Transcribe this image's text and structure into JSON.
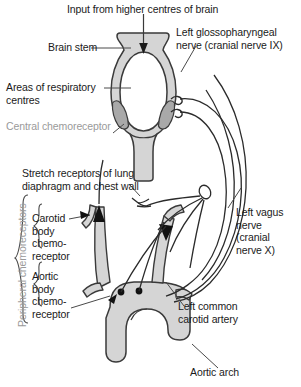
{
  "figure": {
    "type": "anatomical-diagram",
    "width": 301,
    "height": 387,
    "background": "#ffffff"
  },
  "colors": {
    "vessel_fill": "#d5d5d5",
    "vessel_stroke": "#3a3a3a",
    "chemoreceptor_fill": "#a9a9a9",
    "nerve_stroke": "#2b2b2b",
    "label_text": "#1a1a1a",
    "muted_text": "#9a9a9a",
    "leader_line": "#4a4a4a"
  },
  "labels": {
    "input_brain": "Input from higher centres of brain",
    "brain_stem": "Brain stem",
    "glossopharyngeal": "Left glossopharyngeal\nnerve (cranial nerve IX)",
    "respiratory_centres": "Areas of respiratory\ncentres",
    "central_chemoreceptor": "Central chemoreceptor",
    "stretch_receptors": "Stretch receptors of lung\ndiaphragm and chest wall",
    "peripheral_chemoreceptors": "Peripheral chemoreceptors",
    "carotid_body": "Carotid\nbody\nchemo-\nreceptor",
    "aortic_body": "Aortic\nbody\nchemo-\nreceptor",
    "vagus": "Left vagus\nnerve\n(cranial\nnerve X)",
    "left_common_carotid": "Left common\ncarotid artery",
    "aortic_arch": "Aortic arch"
  },
  "structures": [
    {
      "name": "brain-stem",
      "fill": "#d5d5d5"
    },
    {
      "name": "central-chemoreceptor-left",
      "fill": "#a9a9a9"
    },
    {
      "name": "central-chemoreceptor-right",
      "fill": "#a9a9a9"
    },
    {
      "name": "aortic-arch-vessel",
      "fill": "#d5d5d5"
    },
    {
      "name": "right-carotid-artery",
      "fill": "#d5d5d5"
    },
    {
      "name": "left-common-carotid-artery",
      "fill": "#d5d5d5"
    },
    {
      "name": "carotid-body-receptor",
      "fill": "#111111"
    },
    {
      "name": "aortic-body-receptor",
      "fill": "#111111"
    }
  ],
  "icons": {
    "input_arrow": "down-arrow-icon",
    "carotid_arrowhead": "arrowhead-icon",
    "aortic_arrowhead": "arrowhead-icon",
    "ganglion": "ganglion-node-icon",
    "nerve_ending": "nerve-ending-icon"
  }
}
